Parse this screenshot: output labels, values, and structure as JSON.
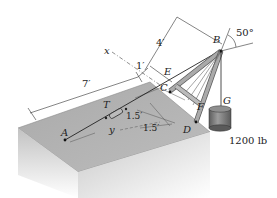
{
  "figure": {
    "points": {
      "A": "A",
      "B": "B",
      "C": "C",
      "D": "D",
      "E": "E",
      "F": "F",
      "G": "G",
      "T": "T"
    },
    "axes": {
      "x": "x",
      "y": "y"
    },
    "dimensions": {
      "d_7ft": "7′",
      "d_1ft": "1′",
      "d_4ft": "4′",
      "d_1_5ft_a": "1.5′",
      "d_1_5ft_b": "1.5′"
    },
    "angle": "50°",
    "load": "1200 lb",
    "colors": {
      "block_top": "#b4b4b4",
      "block_front": "#cfcfcf",
      "block_side": "#a8a8a8",
      "member": "#9a9a9a",
      "line": "#222222",
      "weight": "#7a7a7a"
    }
  }
}
